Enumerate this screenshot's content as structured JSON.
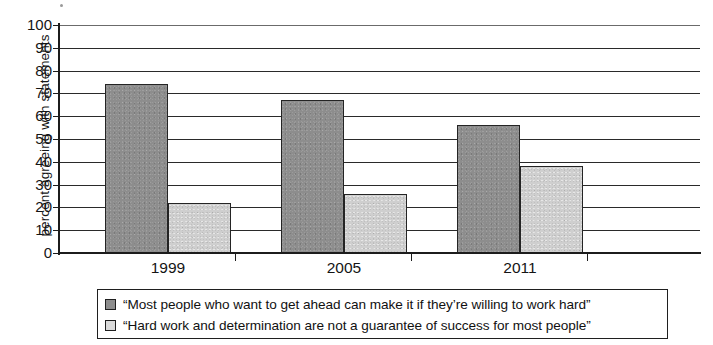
{
  "chart_data": {
    "type": "bar",
    "title": "",
    "xlabel": "",
    "ylabel": "percent agreeing with statements",
    "ylim": [
      0,
      100
    ],
    "ytick_step": 10,
    "yticks": [
      100,
      90,
      80,
      70,
      60,
      50,
      40,
      30,
      20,
      10,
      0
    ],
    "grid": true,
    "legend_position": "bottom",
    "categories": [
      "1999",
      "2005",
      "2011"
    ],
    "series": [
      {
        "name": "“Most people who want to get ahead can make it if they’re willing to work hard”",
        "color": "#8d8d8d",
        "values": [
          74,
          67,
          56
        ]
      },
      {
        "name": "“Hard work and determination are not a guarantee of success for most people”",
        "color": "#cfcfcf",
        "values": [
          22,
          26,
          38
        ]
      }
    ]
  },
  "axes": {
    "y_title": "percent agreeing with statements",
    "y_labels": [
      "100",
      "90",
      "80",
      "70",
      "60",
      "50",
      "40",
      "30",
      "20",
      "10",
      "0"
    ],
    "x_labels": [
      "1999",
      "2005",
      "2011"
    ]
  },
  "legend": {
    "entries": [
      {
        "swatch": "series-dark",
        "label": "“Most people who want to get ahead can make it if they’re willing to work hard”"
      },
      {
        "swatch": "series-light",
        "label": "“Hard work and determination are not a guarantee of success for most people”"
      }
    ]
  }
}
